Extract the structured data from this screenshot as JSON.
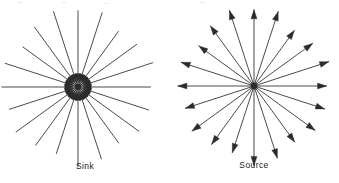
{
  "figure": {
    "background_color": "#ffffff",
    "stroke_color": "#2b2b2b",
    "panels": [
      {
        "id": "sink",
        "caption": "Sink",
        "arrow_direction": "inward",
        "center": {
          "x": 78,
          "y": 87
        },
        "ray_count": 20,
        "ray_length": 74,
        "angle_step_deg": 18,
        "hub_radius": 3.4,
        "arrowhead_radius": 13,
        "arrowhead_length": 9,
        "arrowhead_half_width": 3.0
      },
      {
        "id": "source",
        "caption": "Source",
        "arrow_direction": "outward",
        "center": {
          "x": 85,
          "y": 86
        },
        "ray_count": 20,
        "ray_length": 74,
        "angle_step_deg": 18,
        "hub_radius": 3.4,
        "arrowhead_length": 9,
        "arrowhead_half_width": 3.0
      }
    ]
  },
  "captions": {
    "sink": "Sink",
    "source": "Source"
  },
  "colors": {
    "background": "#ffffff",
    "ink": "#2b2b2b",
    "caption": "#1a1a1a"
  }
}
